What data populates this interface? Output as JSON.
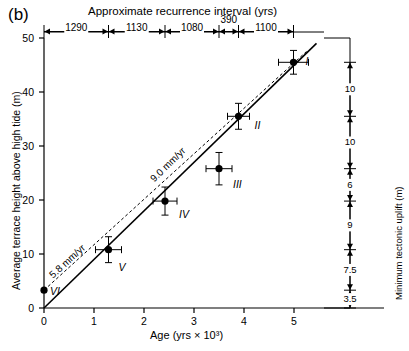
{
  "figure": {
    "panel_label": "(b)",
    "top_axis_title": "Approximate recurrence interval (yrs)",
    "y_axis_title": "Average terrace height above high tide (m)",
    "x_axis_title_pre": "Age (yrs × 10",
    "x_axis_title_sup": "3",
    "x_axis_title_post": ")",
    "right_axis_title": "Minimum tectonic uplift (m)"
  },
  "chart_data": {
    "type": "scatter",
    "xlabel": "Age (yrs × 10³)",
    "ylabel": "Average terrace height above high tide (m)",
    "xlim": [
      0,
      5.6
    ],
    "ylim": [
      0,
      50
    ],
    "xticks": [
      "0",
      "1",
      "2",
      "3",
      "4",
      "5"
    ],
    "yticks": [
      "0",
      "10",
      "20",
      "30",
      "40",
      "50"
    ],
    "grid": false,
    "legend": "none",
    "points": [
      {
        "label": "I",
        "x": 4.99,
        "y": 45.5,
        "xerr": 0.3,
        "yerr": 2.2
      },
      {
        "label": "II",
        "x": 3.89,
        "y": 35.5,
        "xerr": 0.22,
        "yerr": 2.4
      },
      {
        "label": "III",
        "x": 3.5,
        "y": 25.8,
        "xerr": 0.26,
        "yerr": 3.0
      },
      {
        "label": "IV",
        "x": 2.42,
        "y": 19.8,
        "xerr": 0.24,
        "yerr": 2.6
      },
      {
        "label": "V",
        "x": 1.29,
        "y": 10.8,
        "xerr": 0.26,
        "yerr": 2.4
      },
      {
        "label": "VI",
        "x": 0.0,
        "y": 3.3,
        "xerr": 0.0,
        "yerr": 0.0
      }
    ],
    "trend_lines": [
      {
        "name": "9.0 mm/yr",
        "style": "solid",
        "label": "9.0 mm/yr",
        "x0": 0.0,
        "y0": 0.0,
        "x1": 5.45,
        "y1": 49.0
      },
      {
        "name": "5.8 mm/yr",
        "style": "dashed",
        "label": "5.8 mm/yr",
        "x0": 0.0,
        "y0": 3.3,
        "x1": 5.25,
        "y1": 47.5
      }
    ],
    "recurrence_intervals": [
      {
        "value": "1290",
        "from_x": 0.0,
        "to_x": 1.29
      },
      {
        "value": "1130",
        "from_x": 1.29,
        "to_x": 2.42
      },
      {
        "value": "1080",
        "from_x": 2.42,
        "to_x": 3.5
      },
      {
        "value": "390",
        "from_x": 3.5,
        "to_x": 3.89
      },
      {
        "value": "1100",
        "from_x": 3.89,
        "to_x": 4.99
      }
    ],
    "uplift_segments": [
      {
        "value": "10",
        "from_y": 35.5,
        "to_y": 45.5
      },
      {
        "value": "10",
        "from_y": 25.8,
        "to_y": 35.5
      },
      {
        "value": "6",
        "from_y": 19.8,
        "to_y": 25.8
      },
      {
        "value": "9",
        "from_y": 10.8,
        "to_y": 19.8
      },
      {
        "value": "7.5",
        "from_y": 3.3,
        "to_y": 10.8
      },
      {
        "value": "3.5",
        "from_y": 0.0,
        "to_y": 3.3
      }
    ]
  },
  "colors": {
    "ink": "#000000",
    "background": "#ffffff"
  }
}
